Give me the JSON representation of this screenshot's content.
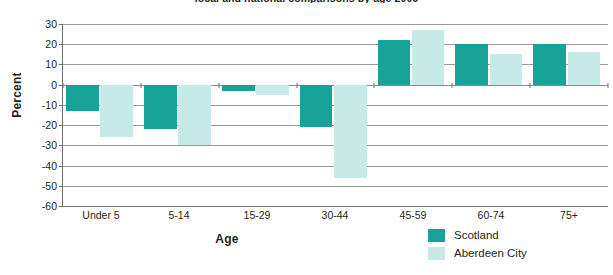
{
  "chart_data": {
    "type": "bar",
    "title": "local and national comparisons by age 2006",
    "xlabel": "Age",
    "ylabel": "Percent",
    "categories": [
      "Under 5",
      "5-14",
      "15-29",
      "30-44",
      "45-59",
      "60-74",
      "75+"
    ],
    "series": [
      {
        "name": "Scotland",
        "color": "#17a398",
        "values": [
          -13,
          -22,
          -3,
          -21,
          22,
          20,
          20
        ]
      },
      {
        "name": "Aberdeen City",
        "color": "#c5eae7",
        "values": [
          -26,
          -30,
          -5,
          -46,
          27,
          15,
          16
        ]
      }
    ],
    "ylim": [
      -60,
      30
    ],
    "ytick_step": 10,
    "ytick_labels": [
      "30",
      "20",
      "10",
      "0",
      "-10",
      "-20",
      "-30",
      "-40",
      "-50",
      "-60"
    ],
    "ytick_values": [
      30,
      20,
      10,
      0,
      -10,
      -20,
      -30,
      -40,
      -50,
      -60
    ],
    "grid": true,
    "legend_position": "bottom-right",
    "zero_line": 0
  }
}
